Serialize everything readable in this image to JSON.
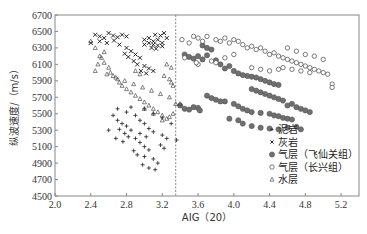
{
  "chart_data": {
    "type": "scatter",
    "title": "",
    "xlabel": "AIG（20）",
    "ylabel": "纵波速度/（m/s）",
    "xlim": [
      2.0,
      5.4
    ],
    "ylim": [
      4500,
      6700
    ],
    "xticks": [
      "2.0",
      "2.4",
      "2.8",
      "3.2",
      "3.6",
      "4.0",
      "4.4",
      "4.8",
      "5.2"
    ],
    "yticks": [
      "4500",
      "4700",
      "4900",
      "5100",
      "5300",
      "5500",
      "5700",
      "5900",
      "6100",
      "6300",
      "6500",
      "6700"
    ],
    "grid": false,
    "legend_position": "lower right",
    "annotations": [
      {
        "type": "dashed-vline",
        "x": 3.35
      }
    ],
    "series": [
      {
        "name": "泥岩",
        "marker": "plus",
        "color": "#222222",
        "points": [
          [
            2.65,
            5480
          ],
          [
            2.7,
            5420
          ],
          [
            2.75,
            5380
          ],
          [
            2.8,
            5350
          ],
          [
            2.85,
            5300
          ],
          [
            2.72,
            5310
          ],
          [
            2.78,
            5260
          ],
          [
            2.82,
            5220
          ],
          [
            2.9,
            5200
          ],
          [
            2.95,
            5150
          ],
          [
            3.0,
            5100
          ],
          [
            3.05,
            5060
          ],
          [
            2.88,
            5050
          ],
          [
            2.92,
            5000
          ],
          [
            3.0,
            4980
          ],
          [
            3.1,
            4950
          ],
          [
            3.15,
            4900
          ],
          [
            2.98,
            4880
          ],
          [
            3.05,
            4840
          ],
          [
            3.12,
            4820
          ],
          [
            2.7,
            5560
          ],
          [
            2.8,
            5520
          ],
          [
            2.9,
            5480
          ],
          [
            2.95,
            5420
          ],
          [
            3.0,
            5380
          ],
          [
            3.05,
            5320
          ],
          [
            3.1,
            5280
          ],
          [
            3.2,
            5240
          ],
          [
            3.25,
            5200
          ],
          [
            2.6,
            5300
          ],
          [
            2.68,
            5200
          ],
          [
            3.18,
            5120
          ],
          [
            3.22,
            5080
          ],
          [
            2.85,
            5580
          ],
          [
            3.0,
            5560
          ],
          [
            3.1,
            5500
          ],
          [
            3.2,
            5450
          ],
          [
            3.3,
            5380
          ],
          [
            3.36,
            5180
          ],
          [
            2.95,
            5260
          ],
          [
            3.02,
            5220
          ],
          [
            2.76,
            5160
          ]
        ]
      },
      {
        "name": "灰岩",
        "marker": "x",
        "color": "#111111",
        "points": [
          [
            2.45,
            6460
          ],
          [
            2.5,
            6440
          ],
          [
            2.55,
            6420
          ],
          [
            2.6,
            6480
          ],
          [
            2.65,
            6450
          ],
          [
            2.7,
            6430
          ],
          [
            2.75,
            6460
          ],
          [
            2.8,
            6440
          ],
          [
            2.5,
            6380
          ],
          [
            2.58,
            6360
          ],
          [
            2.66,
            6390
          ],
          [
            2.72,
            6340
          ],
          [
            2.8,
            6300
          ],
          [
            2.85,
            6260
          ],
          [
            2.9,
            6220
          ],
          [
            2.95,
            6180
          ],
          [
            2.88,
            6140
          ],
          [
            2.92,
            6100
          ],
          [
            3.0,
            6080
          ],
          [
            3.05,
            6050
          ],
          [
            3.1,
            6020
          ],
          [
            3.0,
            6400
          ],
          [
            3.05,
            6420
          ],
          [
            3.1,
            6380
          ],
          [
            3.15,
            6400
          ],
          [
            3.2,
            6360
          ],
          [
            3.05,
            6360
          ],
          [
            3.1,
            6340
          ],
          [
            3.15,
            6330
          ],
          [
            3.2,
            6320
          ],
          [
            3.0,
            6340
          ],
          [
            3.08,
            6300
          ],
          [
            3.13,
            6290
          ],
          [
            3.18,
            6450
          ],
          [
            3.22,
            6480
          ],
          [
            3.12,
            6460
          ],
          [
            3.25,
            6420
          ],
          [
            2.4,
            6360
          ],
          [
            2.96,
            6020
          ],
          [
            3.02,
            5990
          ],
          [
            2.82,
            6190
          ],
          [
            2.78,
            6230
          ]
        ]
      },
      {
        "name": "气层（飞仙关组）",
        "marker": "filled-circle",
        "color": "#666666",
        "points": [
          [
            3.45,
            6220
          ],
          [
            3.5,
            6190
          ],
          [
            3.55,
            6170
          ],
          [
            3.6,
            6200
          ],
          [
            3.65,
            6160
          ],
          [
            3.7,
            6210
          ],
          [
            3.8,
            6150
          ],
          [
            3.85,
            6100
          ],
          [
            3.9,
            6050
          ],
          [
            3.95,
            6080
          ],
          [
            4.0,
            6020
          ],
          [
            4.05,
            5990
          ],
          [
            4.1,
            5970
          ],
          [
            4.15,
            5960
          ],
          [
            4.2,
            5950
          ],
          [
            4.25,
            5940
          ],
          [
            4.3,
            5920
          ],
          [
            4.35,
            5900
          ],
          [
            4.4,
            5880
          ],
          [
            4.45,
            5860
          ],
          [
            4.5,
            5850
          ],
          [
            3.9,
            5650
          ],
          [
            4.0,
            5620
          ],
          [
            4.05,
            5590
          ],
          [
            4.1,
            5560
          ],
          [
            4.15,
            5540
          ],
          [
            4.2,
            5520
          ],
          [
            4.3,
            5510
          ],
          [
            4.4,
            5500
          ],
          [
            4.45,
            5480
          ],
          [
            4.5,
            5470
          ],
          [
            4.55,
            5450
          ],
          [
            4.6,
            5440
          ],
          [
            4.65,
            5430
          ],
          [
            3.4,
            5600
          ],
          [
            3.45,
            5560
          ],
          [
            3.5,
            5550
          ],
          [
            3.55,
            5580
          ],
          [
            3.6,
            5570
          ],
          [
            3.62,
            5540
          ],
          [
            3.7,
            5720
          ],
          [
            3.75,
            5690
          ],
          [
            3.8,
            5670
          ],
          [
            3.85,
            5650
          ],
          [
            4.2,
            5800
          ],
          [
            4.25,
            5780
          ],
          [
            4.3,
            5760
          ],
          [
            4.35,
            5740
          ],
          [
            4.4,
            5720
          ],
          [
            4.45,
            5700
          ],
          [
            4.5,
            5680
          ],
          [
            4.55,
            5660
          ],
          [
            4.2,
            5350
          ],
          [
            4.3,
            5330
          ],
          [
            4.4,
            5320
          ],
          [
            4.5,
            5310
          ],
          [
            4.6,
            5330
          ],
          [
            4.7,
            5340
          ],
          [
            4.75,
            5310
          ],
          [
            4.1,
            5380
          ],
          [
            4.05,
            5420
          ],
          [
            3.95,
            5440
          ],
          [
            4.6,
            5600
          ],
          [
            4.65,
            5620
          ],
          [
            4.7,
            5580
          ],
          [
            4.75,
            5560
          ],
          [
            4.8,
            5540
          ],
          [
            4.85,
            5520
          ],
          [
            3.65,
            6330
          ],
          [
            3.7,
            6300
          ],
          [
            3.75,
            6280
          ]
        ]
      },
      {
        "name": "气层（长兴组）",
        "marker": "open-circle",
        "color": "#444444",
        "points": [
          [
            3.42,
            6400
          ],
          [
            3.5,
            6360
          ],
          [
            3.55,
            6440
          ],
          [
            3.6,
            6420
          ],
          [
            3.65,
            6380
          ],
          [
            3.7,
            6440
          ],
          [
            3.8,
            6400
          ],
          [
            3.85,
            6380
          ],
          [
            3.9,
            6420
          ],
          [
            3.95,
            6360
          ],
          [
            4.0,
            6400
          ],
          [
            4.05,
            6380
          ],
          [
            4.1,
            6340
          ],
          [
            4.15,
            6300
          ],
          [
            4.2,
            6320
          ],
          [
            4.25,
            6280
          ],
          [
            4.3,
            6300
          ],
          [
            4.35,
            6260
          ],
          [
            4.4,
            6220
          ],
          [
            4.45,
            6240
          ],
          [
            4.5,
            6200
          ],
          [
            4.55,
            6180
          ],
          [
            4.6,
            6160
          ],
          [
            4.65,
            6140
          ],
          [
            4.7,
            6120
          ],
          [
            4.75,
            6100
          ],
          [
            4.8,
            6080
          ],
          [
            4.85,
            6060
          ],
          [
            4.9,
            6040
          ],
          [
            4.95,
            6020
          ],
          [
            5.0,
            6000
          ],
          [
            5.05,
            5980
          ],
          [
            4.6,
            6300
          ],
          [
            4.7,
            6260
          ],
          [
            4.8,
            6220
          ],
          [
            4.9,
            6200
          ],
          [
            5.0,
            6160
          ],
          [
            4.2,
            6060
          ],
          [
            4.3,
            6040
          ],
          [
            4.4,
            6020
          ],
          [
            4.5,
            6040
          ],
          [
            4.55,
            6060
          ],
          [
            4.65,
            6040
          ],
          [
            4.75,
            6020
          ],
          [
            4.85,
            6000
          ],
          [
            5.1,
            5860
          ],
          [
            5.1,
            5820
          ],
          [
            3.75,
            6140
          ],
          [
            3.8,
            6120
          ],
          [
            3.9,
            6180
          ],
          [
            4.0,
            6220
          ],
          [
            3.6,
            6100
          ],
          [
            3.58,
            6120
          ],
          [
            3.45,
            6180
          ]
        ]
      },
      {
        "name": "水层",
        "marker": "triangle",
        "color": "#333333",
        "points": [
          [
            2.4,
            6380
          ],
          [
            2.45,
            6300
          ],
          [
            2.5,
            6200
          ],
          [
            2.55,
            6120
          ],
          [
            2.6,
            6060
          ],
          [
            2.62,
            6000
          ],
          [
            2.65,
            5960
          ],
          [
            2.7,
            5920
          ],
          [
            2.72,
            5880
          ],
          [
            2.75,
            5840
          ],
          [
            2.8,
            5800
          ],
          [
            2.85,
            5760
          ],
          [
            2.9,
            5720
          ],
          [
            2.95,
            5680
          ],
          [
            3.0,
            5640
          ],
          [
            3.05,
            5600
          ],
          [
            3.1,
            5560
          ],
          [
            3.15,
            5520
          ],
          [
            3.2,
            5480
          ],
          [
            3.25,
            5440
          ],
          [
            2.58,
            5980
          ],
          [
            2.68,
            5940
          ],
          [
            2.78,
            5900
          ],
          [
            2.88,
            5860
          ],
          [
            2.98,
            5820
          ],
          [
            3.08,
            5780
          ],
          [
            3.18,
            5740
          ],
          [
            3.28,
            5700
          ],
          [
            3.22,
            5960
          ],
          [
            3.28,
            5920
          ],
          [
            3.3,
            5880
          ],
          [
            3.32,
            5840
          ],
          [
            3.25,
            6100
          ],
          [
            3.3,
            6060
          ],
          [
            3.35,
            5620
          ],
          [
            3.32,
            5500
          ],
          [
            3.28,
            5460
          ],
          [
            3.0,
            5560
          ],
          [
            3.1,
            5500
          ],
          [
            3.2,
            5420
          ],
          [
            2.55,
            6250
          ],
          [
            2.52,
            6180
          ],
          [
            2.48,
            6100
          ],
          [
            2.45,
            6020
          ],
          [
            3.4,
            5620
          ],
          [
            2.9,
            6020
          ],
          [
            2.95,
            5980
          ]
        ]
      }
    ]
  },
  "legend": {
    "items": [
      {
        "label": "泥岩",
        "symbol": "+"
      },
      {
        "label": "灰岩",
        "symbol": "×"
      },
      {
        "label": "气层（飞仙关组）",
        "symbol": "●"
      },
      {
        "label": "气层（长兴组）",
        "symbol": "○"
      },
      {
        "label": "水层",
        "symbol": "△"
      }
    ]
  },
  "axes": {
    "xlabel": "AIG（20）",
    "ylabel": "纵波速度/（m/s）"
  }
}
